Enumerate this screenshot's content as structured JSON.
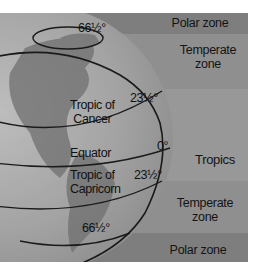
{
  "zones": [
    {
      "label": "Polar zone",
      "color": "#7d7d7d"
    },
    {
      "label": "Temperate zone",
      "line1": "Temperate",
      "line2": "zone",
      "color": "#8e8e8e"
    },
    {
      "label": "Tropics",
      "color": "#979797"
    },
    {
      "label": "Temperate zone",
      "line1": "Temperate",
      "line2": "zone",
      "color": "#8e8e8e"
    },
    {
      "label": "Polar zone",
      "color": "#7d7d7d"
    }
  ],
  "globe": {
    "latitudes": [
      {
        "name": "Arctic circle",
        "degree": "66½°"
      },
      {
        "name": "Tropic of Cancer",
        "line1": "Tropic of",
        "line2": "Cancer",
        "degree": "23½°"
      },
      {
        "name": "Equator",
        "degree": "0°"
      },
      {
        "name": "Tropic of Capricorn",
        "line1": "Tropic of",
        "line2": "Capricorn",
        "degree": "23½°"
      },
      {
        "name": "Antarctic circle",
        "degree": "66½°"
      }
    ]
  }
}
